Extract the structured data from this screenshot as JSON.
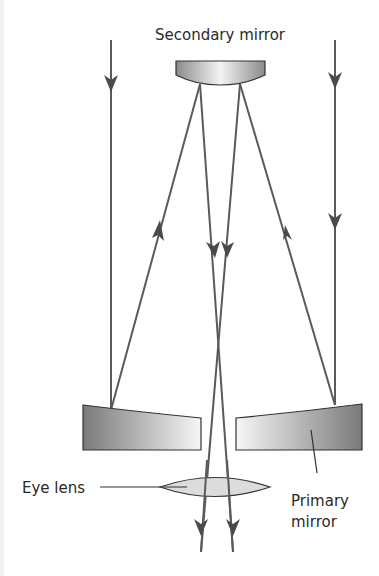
{
  "labels": {
    "secondary_mirror": "Secondary mirror",
    "eye_lens": "Eye lens",
    "primary_mirror_line1": "Primary",
    "primary_mirror_line2": "mirror"
  },
  "colors": {
    "ray": "#5a5a5a",
    "outline": "#333333",
    "lens_fill": "#dcdcdc",
    "text": "#2a2a2a"
  }
}
